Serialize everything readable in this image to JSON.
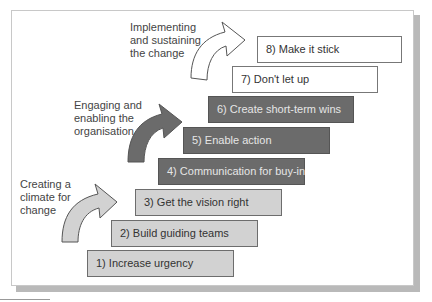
{
  "diagram": {
    "steps": [
      {
        "label": "1) Increase urgency",
        "phase": "climate"
      },
      {
        "label": "2) Build guiding teams",
        "phase": "climate"
      },
      {
        "label": "3) Get the vision right",
        "phase": "climate"
      },
      {
        "label": "4) Communication for buy-in",
        "phase": "engaging"
      },
      {
        "label": "5) Enable action",
        "phase": "engaging"
      },
      {
        "label": "6) Create short-term wins",
        "phase": "engaging"
      },
      {
        "label": "7) Don't let up",
        "phase": "implementing"
      },
      {
        "label": "8) Make it stick",
        "phase": "implementing"
      }
    ],
    "phases": {
      "climate": {
        "line1": "Creating a",
        "line2": "climate for",
        "line3": "change",
        "color": "#d2d2d2"
      },
      "engaging": {
        "line1": "Engaging and",
        "line2": "enabling the",
        "line3": "organisation",
        "color": "#6b6b6b"
      },
      "implementing": {
        "line1": "Implementing",
        "line2": "and sustaining",
        "line3": "the change",
        "color": "#ffffff"
      }
    }
  }
}
